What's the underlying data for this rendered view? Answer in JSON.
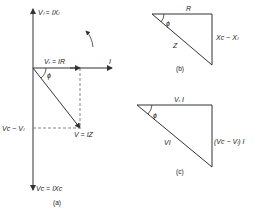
{
  "figure_a": {
    "caption": "(a)",
    "labels": {
      "vl": "Vₗ = IXₗ",
      "vr": "Vᵣ = IR",
      "i": "I",
      "phi": "ϕ",
      "vc_minus_vl": "Vᴄ − Vₗ",
      "v": "V = IZ",
      "vc": "Vᴄ = IXᴄ"
    }
  },
  "figure_b": {
    "caption": "(b)",
    "labels": {
      "r": "R",
      "phi": "ϕ",
      "z": "Z",
      "xc_minus_xl": "Xᴄ − Xₗ"
    }
  },
  "figure_c": {
    "caption": "(c)",
    "labels": {
      "vri": "Vᵣ I",
      "phi": "ϕ",
      "vi": "VI",
      "vcvl_i": "(Vᴄ − Vₗ) I"
    }
  },
  "colors": {
    "line": "#333333",
    "dashed": "#666666",
    "background": "#ffffff"
  }
}
